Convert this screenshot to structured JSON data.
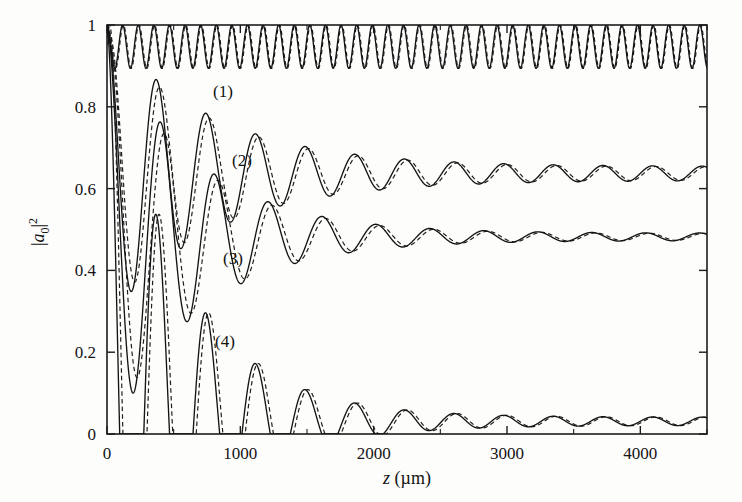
{
  "figure": {
    "background_color": "#fdfdfc",
    "line_color": "#141414"
  },
  "axes": {
    "x_title_var": "z",
    "x_title_unit": "(µm)",
    "y_title": "|a0|²",
    "y_title_parts": {
      "bar_left": "|",
      "a": "a",
      "sub": "0",
      "bar_right": "|",
      "sup": "2"
    },
    "x_ticklabels": [
      "0",
      "1000",
      "2000",
      "3000",
      "4000"
    ],
    "y_ticklabels": [
      "0",
      "0.2",
      "0.4",
      "0.6",
      "0.8",
      "1"
    ]
  },
  "curve_labels": [
    {
      "text": "(1)",
      "x": 213,
      "y": 97
    },
    {
      "text": "(2)",
      "x": 232,
      "y": 166
    },
    {
      "text": "(3)",
      "x": 223,
      "y": 264
    },
    {
      "text": "(4)",
      "x": 215,
      "y": 347
    }
  ],
  "chart_data": {
    "type": "line",
    "title": "",
    "xlabel": "z (µm)",
    "ylabel": "|a0|^2",
    "xlim": [
      0,
      4500
    ],
    "ylim": [
      0,
      1
    ],
    "xticks": [
      0,
      1000,
      2000,
      3000,
      4000
    ],
    "xticks_minor": [
      500,
      1500,
      2500,
      3500,
      4500
    ],
    "yticks": [
      0,
      0.2,
      0.4,
      0.6,
      0.8,
      1
    ],
    "grid": false,
    "legend": "inline-labels",
    "series": [
      {
        "name": "(1)",
        "label": "(1)",
        "style": [
          "solid",
          "dashed"
        ],
        "model": "undamped_oscillation",
        "start_value": 1.0,
        "asymptote": 0.947,
        "amplitude_initial": 0.053,
        "amplitude_final": 0.053,
        "damping_length_um": 100000,
        "period_um": 117,
        "phase": 0.0,
        "dash_offset_um": 6,
        "dash_amp_scale": 1.0
      },
      {
        "name": "(2)",
        "label": "(2)",
        "style": [
          "solid",
          "dashed"
        ],
        "model": "damped_oscillation",
        "start_value": 1.0,
        "asymptote": 0.637,
        "amplitude_initial": 0.363,
        "amplitude_final": 0.017,
        "damping_length_um": 760,
        "period_um": 372,
        "phase": 0.0,
        "dash_offset_um": 26,
        "dash_amp_scale": 0.92
      },
      {
        "name": "(3)",
        "label": "(3)",
        "style": [
          "solid",
          "dashed"
        ],
        "model": "damped_oscillation",
        "start_value": 1.0,
        "asymptote": 0.482,
        "amplitude_initial": 0.518,
        "amplitude_final": 0.009,
        "damping_length_um": 640,
        "period_um": 404,
        "phase": 0.0,
        "dash_offset_um": 30,
        "dash_amp_scale": 0.9
      },
      {
        "name": "(4)",
        "label": "(4)",
        "style": [
          "solid",
          "dashed"
        ],
        "model": "damped_oscillation",
        "start_value": 1.0,
        "asymptote": 0.031,
        "amplitude_initial": 0.969,
        "amplitude_final": 0.01,
        "damping_length_um": 560,
        "period_um": 372,
        "phase": 0.0,
        "dash_offset_um": 24,
        "dash_amp_scale": 1.0
      }
    ],
    "sampled_points": {
      "x": [
        0,
        250,
        500,
        750,
        1000,
        1500,
        2000,
        2500,
        3000,
        3500,
        4000,
        4500
      ],
      "(1)": [
        1.0,
        0.9,
        0.995,
        0.9,
        0.995,
        0.9,
        0.995,
        0.9,
        0.995,
        0.9,
        0.995,
        0.96
      ],
      "(2)": [
        1.0,
        0.47,
        0.63,
        0.77,
        0.58,
        0.71,
        0.6,
        0.665,
        0.615,
        0.655,
        0.625,
        0.645
      ],
      "(3)": [
        1.0,
        0.42,
        0.74,
        0.42,
        0.58,
        0.455,
        0.49,
        0.478,
        0.487,
        0.479,
        0.485,
        0.48
      ],
      "(4)": [
        1.0,
        0.155,
        0.4,
        0.005,
        0.19,
        0.02,
        0.065,
        0.028,
        0.042,
        0.029,
        0.036,
        0.031
      ]
    }
  }
}
